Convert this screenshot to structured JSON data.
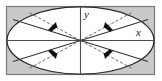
{
  "figure": {
    "canvas": {
      "width": 162,
      "height": 81,
      "background": "#ffffff"
    },
    "frame": {
      "name": "outer-rectangle",
      "x": 6,
      "y": 6,
      "width": 149,
      "height": 69,
      "stroke": "#7a7a7a",
      "fill": "#c9c9c9"
    },
    "ellipse": {
      "name": "inscribed-ellipse",
      "cx": 80.5,
      "cy": 40.5,
      "rx": 74,
      "ry": 34,
      "stroke": "#2b2b2b",
      "fill": "#ffffff"
    },
    "axes": {
      "x_label": "x",
      "y_label": "y",
      "x_label_pos": {
        "x": 137,
        "y": 35
      },
      "y_label_pos": {
        "x": 84,
        "y": 17
      },
      "stroke": "#4d4d4d",
      "center": {
        "x": 80.5,
        "y": 40.5
      }
    },
    "solid_rays": [
      {
        "name": "ray-upper-left",
        "angle_deg": 160
      },
      {
        "name": "ray-upper-right",
        "angle_deg": 20
      },
      {
        "name": "ray-lower-left",
        "angle_deg": 200
      },
      {
        "name": "ray-lower-right",
        "angle_deg": 340
      }
    ],
    "dashed_rays": [
      {
        "name": "dashed-ray-upper-left",
        "angle_deg": 135
      },
      {
        "name": "dashed-ray-upper-right",
        "angle_deg": 45
      },
      {
        "name": "dashed-ray-lower-left",
        "angle_deg": 225
      },
      {
        "name": "dashed-ray-lower-right",
        "angle_deg": 315
      }
    ],
    "arrows": [
      {
        "name": "arrow-upper-left",
        "direction": "down-left"
      },
      {
        "name": "arrow-upper-right",
        "direction": "up-right"
      },
      {
        "name": "arrow-lower-left",
        "direction": "down-left"
      },
      {
        "name": "arrow-lower-right",
        "direction": "down-right"
      }
    ],
    "colors": {
      "frame_fill": "#c9c9c9",
      "frame_stroke": "#7a7a7a",
      "ellipse_fill": "#ffffff",
      "ellipse_stroke": "#2b2b2b",
      "axis": "#4d4d4d",
      "ray": "#333333",
      "dash": "#555555",
      "arrow": "#111111"
    }
  }
}
